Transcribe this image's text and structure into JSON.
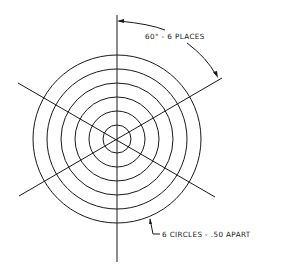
{
  "drawing": {
    "type": "technical-drawing",
    "description": "Polar target: concentric circles with radial lines",
    "center": {
      "x": 117,
      "y": 139
    },
    "circles": {
      "count": 6,
      "radii_px": [
        14,
        28,
        42,
        56,
        70,
        84
      ]
    },
    "radial_lines": {
      "count": 6,
      "angle_step_deg": 60,
      "angles_deg": [
        90,
        30,
        -30,
        -90,
        150,
        210
      ]
    },
    "annotations": {
      "angle_label": "60° - 6 PLACES",
      "circles_label": "6 CIRCLES - .50 APART"
    },
    "colors": {
      "line": "#1a1a1a",
      "background": "#ffffff"
    }
  }
}
